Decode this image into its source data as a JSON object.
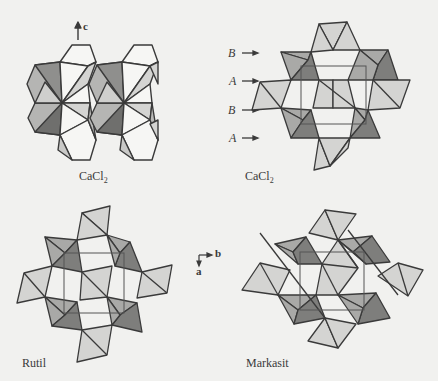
{
  "figure": {
    "panels": [
      {
        "id": "cacl2-side",
        "label": "CaCl",
        "subscript": "2",
        "axis_label": "c"
      },
      {
        "id": "cacl2-top",
        "label": "CaCl",
        "subscript": "2",
        "layers": [
          "B",
          "A",
          "B",
          "A"
        ]
      },
      {
        "id": "rutil",
        "label": "Rutil"
      },
      {
        "id": "markasit",
        "label": "Markasit"
      }
    ],
    "axes": {
      "horizontal": "b",
      "vertical": "a"
    },
    "colors": {
      "background": "#f1f1ef",
      "light": "#d4d4d2",
      "medium": "#a9a9a7",
      "dark": "#7a7a78",
      "white": "#f6f6f4",
      "line": "#3a3a3a"
    }
  }
}
